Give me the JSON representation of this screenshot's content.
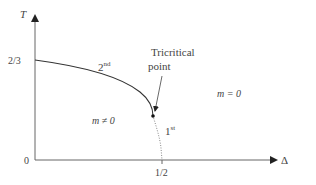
{
  "diagram": {
    "type": "phase-diagram",
    "axes": {
      "y_label": "T",
      "x_label": "Δ",
      "origin_label": "0",
      "y_tick_label": "2/3",
      "x_tick_label": "1/2"
    },
    "curves": {
      "second_order_label_base": "2",
      "second_order_label_sup": "nd",
      "first_order_label_base": "1",
      "first_order_label_sup": "st"
    },
    "annotation": {
      "line1": "Tricritical",
      "line2": "point"
    },
    "regions": {
      "ordered": "m ≠ 0",
      "disordered": "m = 0"
    },
    "colors": {
      "axis": "#555555",
      "curve": "#333333",
      "text": "#444444"
    }
  }
}
